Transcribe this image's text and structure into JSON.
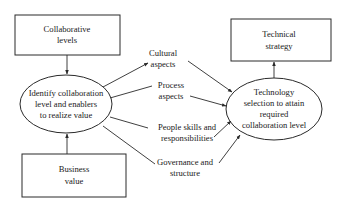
{
  "diagram": {
    "colors": {
      "line": "#2a2a2a",
      "text": "#1a1a1a",
      "background": "#ffffff"
    },
    "nodes": {
      "collaborative_levels": {
        "shape": "rectangle",
        "lines": [
          "Collaborative",
          "levels"
        ]
      },
      "identify": {
        "shape": "ellipse",
        "lines": [
          "Identify collaboration",
          "level and enablers",
          "to realize value"
        ]
      },
      "business_value": {
        "shape": "rectangle",
        "lines": [
          "Business",
          "value"
        ]
      },
      "technical_strategy": {
        "shape": "rectangle",
        "lines": [
          "Technical",
          "strategy"
        ]
      },
      "technology_selection": {
        "shape": "ellipse",
        "lines": [
          "Technology",
          "selection to attain",
          "required",
          "collaboration level"
        ]
      }
    },
    "enablers": [
      {
        "id": "cultural",
        "lines": [
          "Cultural",
          "aspects"
        ]
      },
      {
        "id": "process",
        "lines": [
          "Process",
          "aspects"
        ]
      },
      {
        "id": "people",
        "lines": [
          "People skills and",
          "responsibilities"
        ]
      },
      {
        "id": "governance",
        "lines": [
          "Governance and",
          "structure"
        ]
      }
    ],
    "edges": [
      {
        "from": "collaborative_levels",
        "to": "identify",
        "arrow": true
      },
      {
        "from": "business_value",
        "to": "identify",
        "arrow": true
      },
      {
        "from": "identify",
        "to": "cultural",
        "arrow": true
      },
      {
        "from": "identify",
        "to": "process",
        "arrow": false
      },
      {
        "from": "identify",
        "to": "people",
        "arrow": false
      },
      {
        "from": "identify",
        "to": "governance",
        "arrow": false
      },
      {
        "from": "cultural",
        "to": "technology_selection",
        "arrow": true
      },
      {
        "from": "process",
        "to": "technology_selection",
        "arrow": true
      },
      {
        "from": "people",
        "to": "technology_selection",
        "arrow": true
      },
      {
        "from": "governance",
        "to": "technology_selection",
        "arrow": true
      },
      {
        "from": "technology_selection",
        "to": "technical_strategy",
        "arrow": true
      }
    ]
  }
}
